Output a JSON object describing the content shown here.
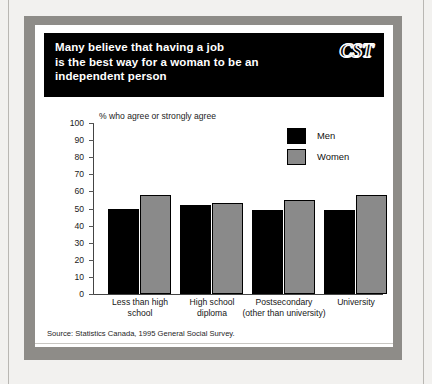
{
  "banner": {
    "title": "Many believe that having a job\nis the best way for a woman to be an\nindependent person",
    "logo": "CST"
  },
  "source": "Source: Statistics Canada, 1995 General Social Survey.",
  "legend": {
    "men_label": "Men",
    "women_label": "Women",
    "men_color": "#000000",
    "women_color": "#8a8a8a"
  },
  "chart_data": {
    "type": "bar",
    "title": "Many believe that having a job is the best way for a woman to be an independent person",
    "ylabel": "% who agree or strongly agree",
    "xlabel": "",
    "ylim": [
      0,
      100
    ],
    "yticks": [
      0,
      10,
      20,
      30,
      40,
      50,
      60,
      70,
      80,
      90,
      100
    ],
    "ytick_labels": [
      "0",
      "10",
      "20",
      "30",
      "40",
      "50",
      "60",
      "70",
      "80",
      "90",
      "100"
    ],
    "grid": false,
    "legend_position": "top-right",
    "categories": [
      "Less than high\nschool",
      "High school\ndiploma",
      "Postsecondary\n(other than university)",
      "University"
    ],
    "series": [
      {
        "name": "Men",
        "color": "#000000",
        "values": [
          50,
          52,
          49,
          49
        ]
      },
      {
        "name": "Women",
        "color": "#8a8a8a",
        "values": [
          58,
          53,
          55,
          58
        ]
      }
    ]
  }
}
